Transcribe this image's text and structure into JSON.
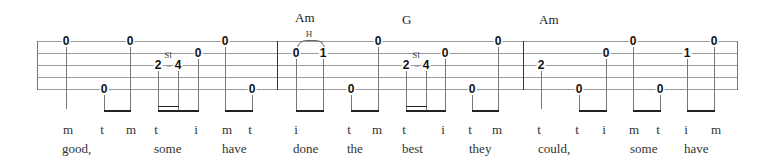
{
  "chords": [
    {
      "label": "Am",
      "x": 295,
      "y": 11
    },
    {
      "label": "G",
      "x": 402,
      "y": 13
    },
    {
      "label": "Am",
      "x": 539,
      "y": 13
    }
  ],
  "techniques": [
    {
      "label": "H",
      "x": 309,
      "y": 30
    },
    {
      "label": "Sl",
      "x": 168,
      "y": 50
    },
    {
      "label": "Sl",
      "x": 416,
      "y": 50
    }
  ],
  "notes": [
    {
      "fret": "0",
      "x": 66,
      "string": 1
    },
    {
      "fret": "0",
      "x": 104,
      "string": 5
    },
    {
      "fret": "0",
      "x": 130,
      "string": 1
    },
    {
      "fret": "2",
      "x": 158,
      "string": 3
    },
    {
      "fret": "4",
      "x": 178,
      "string": 3
    },
    {
      "fret": "0",
      "x": 198,
      "string": 2
    },
    {
      "fret": "0",
      "x": 225,
      "string": 1
    },
    {
      "fret": "0",
      "x": 252,
      "string": 5
    },
    {
      "fret": "0",
      "x": 296,
      "string": 2
    },
    {
      "fret": "1",
      "x": 323,
      "string": 2
    },
    {
      "fret": "0",
      "x": 351,
      "string": 5
    },
    {
      "fret": "0",
      "x": 378,
      "string": 1
    },
    {
      "fret": "2",
      "x": 406,
      "string": 3
    },
    {
      "fret": "4",
      "x": 426,
      "string": 3
    },
    {
      "fret": "0",
      "x": 445,
      "string": 2
    },
    {
      "fret": "0",
      "x": 472,
      "string": 5
    },
    {
      "fret": "0",
      "x": 498,
      "string": 1
    },
    {
      "fret": "2",
      "x": 541,
      "string": 3
    },
    {
      "fret": "0",
      "x": 579,
      "string": 5
    },
    {
      "fret": "0",
      "x": 606,
      "string": 2
    },
    {
      "fret": "0",
      "x": 633,
      "string": 1
    },
    {
      "fret": "0",
      "x": 660,
      "string": 5
    },
    {
      "fret": "1",
      "x": 687,
      "string": 2
    },
    {
      "fret": "0",
      "x": 714,
      "string": 1
    }
  ],
  "fingers": [
    {
      "label": "m",
      "x": 68
    },
    {
      "label": "t",
      "x": 102
    },
    {
      "label": "m",
      "x": 131
    },
    {
      "label": "t",
      "x": 156
    },
    {
      "label": "i",
      "x": 196
    },
    {
      "label": "m",
      "x": 227
    },
    {
      "label": "t",
      "x": 250
    },
    {
      "label": "i",
      "x": 296
    },
    {
      "label": "t",
      "x": 349
    },
    {
      "label": "m",
      "x": 377
    },
    {
      "label": "t",
      "x": 404
    },
    {
      "label": "i",
      "x": 443
    },
    {
      "label": "t",
      "x": 470
    },
    {
      "label": "m",
      "x": 497
    },
    {
      "label": "t",
      "x": 539
    },
    {
      "label": "t",
      "x": 577
    },
    {
      "label": "i",
      "x": 604
    },
    {
      "label": "m",
      "x": 634
    },
    {
      "label": "t",
      "x": 658
    },
    {
      "label": "i",
      "x": 686
    },
    {
      "label": "m",
      "x": 716
    }
  ],
  "lyrics": [
    {
      "word": "good,",
      "x": 62
    },
    {
      "word": "some",
      "x": 154
    },
    {
      "word": "have",
      "x": 222
    },
    {
      "word": "done",
      "x": 293
    },
    {
      "word": "the",
      "x": 347
    },
    {
      "word": "best",
      "x": 402
    },
    {
      "word": "they",
      "x": 469
    },
    {
      "word": "could,",
      "x": 538
    },
    {
      "word": "some",
      "x": 630
    },
    {
      "word": "have",
      "x": 684
    }
  ]
}
